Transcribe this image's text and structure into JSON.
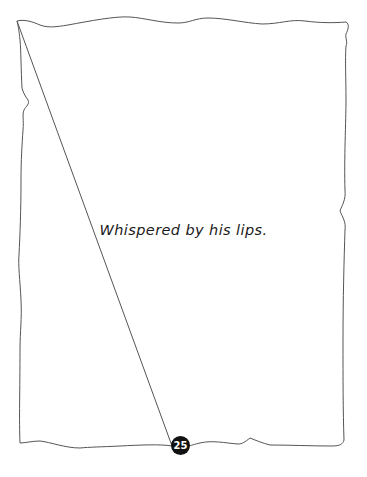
{
  "page": {
    "caption": "Whispered by his lips.",
    "page_number": "25"
  },
  "colors": {
    "background": "#ffffff",
    "frame_stroke": "#555555",
    "text": "#1a1a1a",
    "page_badge": "#111111",
    "page_badge_text": "#ffffff"
  }
}
